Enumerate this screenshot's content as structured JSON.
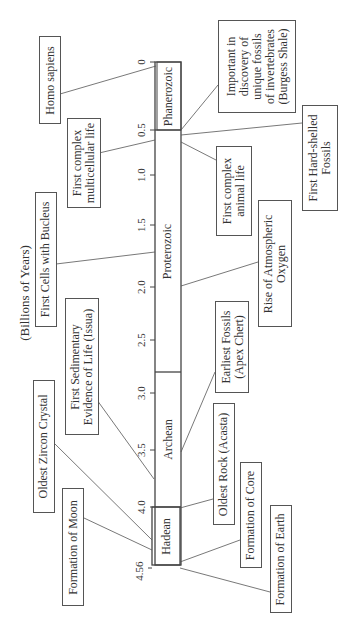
{
  "axis": {
    "title": "(Billions of Years)",
    "ticks": [
      "0",
      "0.5",
      "1.0",
      "1.5",
      "2.0",
      "2.5",
      "3.0",
      "3.5",
      "4.0",
      "4.56"
    ]
  },
  "eras": [
    {
      "name": "Phanerozoic",
      "start": 0,
      "end": 0.5
    },
    {
      "name": "Proterozoic",
      "start": 0.5,
      "end": 2.5
    },
    {
      "name": "Archean",
      "start": 2.5,
      "end": 4.0
    },
    {
      "name": "Hadean",
      "start": 4.0,
      "end": 4.56
    }
  ],
  "events": {
    "homo_sapiens": {
      "lines": [
        "Homo sapiens"
      ]
    },
    "first_complex_multicellular": {
      "lines": [
        "First complex",
        "multicellular life"
      ]
    },
    "first_cells_nucleus": {
      "lines": [
        "First Cells with Bucleus"
      ]
    },
    "first_sedimentary": {
      "lines": [
        "First Sedimentary",
        "Evidence of Life (Issua)"
      ]
    },
    "oldest_zircon": {
      "lines": [
        "Oldest Zircon Crystal"
      ]
    },
    "formation_moon": {
      "lines": [
        "Formation of Moon"
      ]
    },
    "burgess_shale": {
      "lines": [
        "Important in",
        "discovery of",
        "unique fossils",
        "of invertebrates",
        "(Burgess Shale)"
      ]
    },
    "first_hard_shelled": {
      "lines": [
        "First Hard-shelled",
        "Fossils"
      ]
    },
    "first_complex_animal": {
      "lines": [
        "First complex",
        "animal life"
      ]
    },
    "rise_oxygen": {
      "lines": [
        "Rise of Atmospheric",
        "Oxygen"
      ]
    },
    "earliest_fossils": {
      "lines": [
        "Earliest Fossils",
        "(Apex Chert)"
      ]
    },
    "oldest_rock": {
      "lines": [
        "Oldest Rock (Acasta)"
      ]
    },
    "formation_core": {
      "lines": [
        "Formation of Core"
      ]
    },
    "formation_earth": {
      "lines": [
        "Formation of Earth"
      ]
    }
  },
  "colors": {
    "line": "#555555",
    "text": "#333333",
    "background": "#ffffff"
  }
}
